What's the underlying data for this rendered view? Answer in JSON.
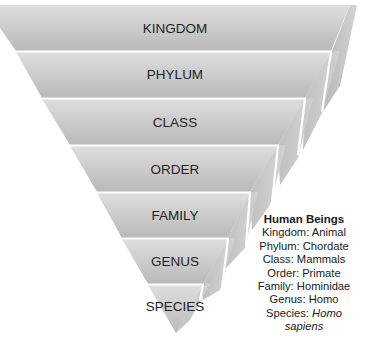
{
  "diagram": {
    "colors": {
      "face_light": "#dcdcdc",
      "face_dark": "#b4b4b4",
      "side": "#c6c6c6",
      "divider": "#ffffff",
      "text": "#1f1f1f"
    },
    "layers": [
      {
        "label": "KINGDOM"
      },
      {
        "label": "PHYLUM"
      },
      {
        "label": "CLASS"
      },
      {
        "label": "ORDER"
      },
      {
        "label": "FAMILY"
      },
      {
        "label": "GENUS"
      },
      {
        "label": "SPECIES"
      }
    ]
  },
  "annotation": {
    "title": "Human Beings",
    "lines": [
      "Kingdom: Animal",
      "Phylum: Chordate",
      "Class: Mammals",
      "Order: Primate",
      "Family: Hominidae",
      "Genus: Homo"
    ],
    "species_prefix": "Species: ",
    "species_italic_1": "Homo",
    "species_italic_2": "sapiens"
  }
}
